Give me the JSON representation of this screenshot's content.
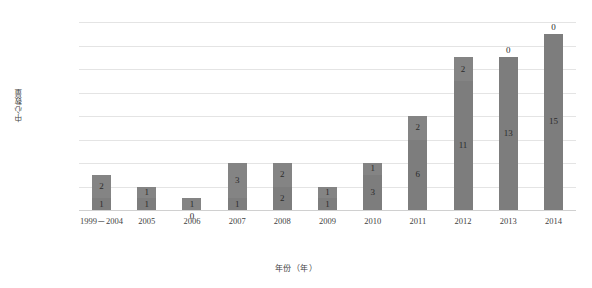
{
  "chart_data": {
    "type": "bar",
    "stacked": true,
    "title": "",
    "xlabel": "年份（年）",
    "ylabel": "中心数量",
    "categories": [
      "1999－2004",
      "2005",
      "2006",
      "2007",
      "2008",
      "2009",
      "2010",
      "2011",
      "2012",
      "2013",
      "2014"
    ],
    "series": [
      {
        "name": "bottom",
        "values": [
          1,
          1,
          0,
          1,
          2,
          1,
          3,
          6,
          11,
          13,
          15
        ]
      },
      {
        "name": "top",
        "values": [
          2,
          1,
          1,
          3,
          2,
          1,
          1,
          2,
          2,
          0,
          0
        ]
      }
    ],
    "totals": [
      3,
      2,
      1,
      4,
      4,
      2,
      4,
      8,
      13,
      13,
      15
    ],
    "ylim": [
      0,
      16
    ],
    "yticks": [
      "0",
      "2",
      "4",
      "6",
      "8",
      "10",
      "12",
      "14",
      "16"
    ],
    "grid": true,
    "legend": "none",
    "bar_color": "#808080",
    "gridline_color": "#e4e4e4",
    "label_placement": {
      "2006_bottom": "below-outside",
      "2013_top": "above-outside",
      "2014_top": "above-outside"
    }
  },
  "axis": {
    "y_title": "中心数量",
    "x_title": "年份（年）"
  }
}
